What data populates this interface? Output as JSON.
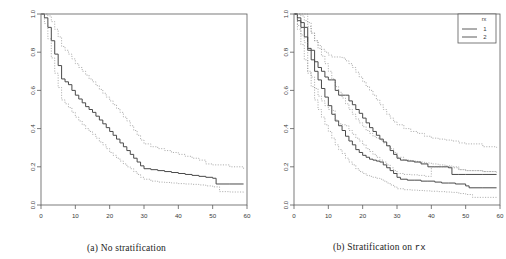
{
  "figure": {
    "panels": [
      {
        "id": "panel-a",
        "caption_prefix": "(a) No stratification",
        "caption_mono": "",
        "has_legend": false
      },
      {
        "id": "panel-b",
        "caption_prefix": "(b) Stratification on ",
        "caption_mono": "rx",
        "has_legend": true
      }
    ],
    "legend": {
      "title": "rx",
      "entries": [
        {
          "label": "1",
          "style": "solid"
        },
        {
          "label": "2",
          "style": "solid"
        }
      ]
    },
    "style": {
      "curve_color": "#4a4a4a",
      "band_color": "#8c8c8c",
      "axis_color": "#5a5a5a",
      "background": "#ffffff"
    }
  },
  "chart_data": [
    {
      "type": "line",
      "title": "(a) No stratification",
      "xlabel": "",
      "ylabel": "",
      "xlim": [
        0,
        60
      ],
      "ylim": [
        0,
        1.0
      ],
      "xticks": [
        0,
        10,
        20,
        30,
        40,
        50,
        60
      ],
      "yticks": [
        0.0,
        0.2,
        0.4,
        0.6,
        0.8,
        1.0
      ],
      "grid": false,
      "legend_position": "none",
      "series": [
        {
          "name": "estimate",
          "style": "step-solid",
          "x": [
            0,
            1,
            2,
            3,
            4,
            5,
            6,
            7,
            8,
            9,
            10,
            11,
            12,
            13,
            14,
            15,
            16,
            17,
            18,
            19,
            20,
            21,
            22,
            23,
            24,
            25,
            26,
            27,
            28,
            29,
            30,
            32,
            34,
            36,
            38,
            40,
            42,
            44,
            46,
            48,
            50,
            51,
            55,
            59
          ],
          "y": [
            1.0,
            0.98,
            0.93,
            0.86,
            0.79,
            0.73,
            0.66,
            0.645,
            0.63,
            0.6,
            0.575,
            0.555,
            0.535,
            0.515,
            0.5,
            0.485,
            0.465,
            0.445,
            0.425,
            0.405,
            0.385,
            0.365,
            0.345,
            0.325,
            0.305,
            0.285,
            0.265,
            0.245,
            0.225,
            0.205,
            0.19,
            0.185,
            0.18,
            0.175,
            0.17,
            0.165,
            0.16,
            0.155,
            0.15,
            0.145,
            0.14,
            0.11,
            0.11,
            0.11
          ]
        },
        {
          "name": "upper-95",
          "style": "step-dotted",
          "x": [
            0,
            1,
            2,
            3,
            4,
            5,
            6,
            7,
            8,
            9,
            10,
            11,
            12,
            13,
            14,
            15,
            16,
            17,
            18,
            19,
            20,
            21,
            22,
            23,
            24,
            25,
            26,
            27,
            28,
            29,
            30,
            32,
            34,
            36,
            38,
            40,
            42,
            44,
            46,
            48,
            50,
            55,
            59
          ],
          "y": [
            1.0,
            1.0,
            0.99,
            0.96,
            0.92,
            0.88,
            0.83,
            0.81,
            0.79,
            0.765,
            0.74,
            0.72,
            0.7,
            0.68,
            0.66,
            0.645,
            0.625,
            0.605,
            0.585,
            0.565,
            0.545,
            0.525,
            0.505,
            0.485,
            0.46,
            0.44,
            0.415,
            0.39,
            0.365,
            0.34,
            0.32,
            0.305,
            0.295,
            0.285,
            0.275,
            0.265,
            0.255,
            0.245,
            0.235,
            0.215,
            0.21,
            0.2,
            0.185
          ]
        },
        {
          "name": "lower-95",
          "style": "step-dotted",
          "x": [
            0,
            1,
            2,
            3,
            4,
            5,
            6,
            7,
            8,
            9,
            10,
            11,
            12,
            13,
            14,
            15,
            16,
            17,
            18,
            19,
            20,
            21,
            22,
            23,
            24,
            25,
            26,
            27,
            28,
            29,
            30,
            32,
            34,
            36,
            38,
            40,
            42,
            44,
            46,
            48,
            50,
            52,
            55,
            59
          ],
          "y": [
            1.0,
            0.95,
            0.87,
            0.77,
            0.69,
            0.615,
            0.55,
            0.53,
            0.51,
            0.485,
            0.46,
            0.44,
            0.42,
            0.4,
            0.385,
            0.37,
            0.35,
            0.33,
            0.315,
            0.295,
            0.275,
            0.26,
            0.245,
            0.23,
            0.215,
            0.2,
            0.19,
            0.175,
            0.16,
            0.145,
            0.135,
            0.125,
            0.12,
            0.118,
            0.115,
            0.112,
            0.11,
            0.108,
            0.105,
            0.1,
            0.095,
            0.07,
            0.068,
            0.065
          ]
        }
      ]
    },
    {
      "type": "line",
      "title": "(b) Stratification on rx",
      "xlabel": "",
      "ylabel": "",
      "xlim": [
        0,
        60
      ],
      "ylim": [
        0,
        1.0
      ],
      "xticks": [
        0,
        10,
        20,
        30,
        40,
        50,
        60
      ],
      "yticks": [
        0.0,
        0.2,
        0.4,
        0.6,
        0.8,
        1.0
      ],
      "grid": false,
      "legend_position": "top-right",
      "legend_title": "rx",
      "series": [
        {
          "name": "rx=1 estimate",
          "style": "step-solid",
          "x": [
            0,
            1,
            2,
            3,
            4,
            5,
            6,
            7,
            8,
            9,
            10,
            11,
            12,
            13,
            14,
            15,
            16,
            17,
            18,
            19,
            20,
            21,
            22,
            23,
            24,
            25,
            26,
            27,
            28,
            29,
            30,
            31,
            33,
            35,
            37,
            39,
            41,
            43,
            45,
            47,
            50,
            51,
            55,
            59
          ],
          "y": [
            1.0,
            0.965,
            0.93,
            0.88,
            0.82,
            0.76,
            0.7,
            0.655,
            0.61,
            0.565,
            0.52,
            0.475,
            0.44,
            0.415,
            0.39,
            0.36,
            0.335,
            0.315,
            0.29,
            0.275,
            0.26,
            0.25,
            0.24,
            0.235,
            0.23,
            0.225,
            0.21,
            0.195,
            0.18,
            0.165,
            0.145,
            0.135,
            0.13,
            0.13,
            0.125,
            0.125,
            0.12,
            0.115,
            0.115,
            0.11,
            0.1,
            0.09,
            0.09,
            0.09
          ]
        },
        {
          "name": "rx=1 upper",
          "style": "step-dotted",
          "x": [
            0,
            1,
            2,
            3,
            4,
            5,
            6,
            7,
            8,
            9,
            10,
            11,
            12,
            13,
            14,
            15,
            16,
            17,
            18,
            19,
            20,
            21,
            22,
            23,
            24,
            25,
            26,
            27,
            28,
            29,
            30,
            32,
            34,
            36,
            38,
            40,
            42,
            44,
            46,
            48,
            50,
            55,
            59
          ],
          "y": [
            1.0,
            1.0,
            0.99,
            0.965,
            0.935,
            0.9,
            0.86,
            0.82,
            0.78,
            0.74,
            0.7,
            0.66,
            0.62,
            0.59,
            0.56,
            0.53,
            0.5,
            0.475,
            0.45,
            0.43,
            0.41,
            0.39,
            0.375,
            0.36,
            0.35,
            0.34,
            0.325,
            0.31,
            0.295,
            0.275,
            0.25,
            0.235,
            0.23,
            0.225,
            0.22,
            0.215,
            0.21,
            0.205,
            0.2,
            0.185,
            0.18,
            0.175,
            0.17
          ]
        },
        {
          "name": "rx=1 lower",
          "style": "step-dotted",
          "x": [
            0,
            1,
            2,
            3,
            4,
            5,
            6,
            7,
            8,
            9,
            10,
            11,
            12,
            13,
            14,
            15,
            16,
            17,
            18,
            19,
            20,
            21,
            22,
            23,
            24,
            25,
            26,
            27,
            28,
            29,
            30,
            32,
            34,
            36,
            38,
            40,
            42,
            44,
            46,
            48,
            50,
            52,
            55,
            59
          ],
          "y": [
            1.0,
            0.92,
            0.84,
            0.76,
            0.69,
            0.62,
            0.55,
            0.5,
            0.46,
            0.42,
            0.385,
            0.35,
            0.315,
            0.29,
            0.27,
            0.245,
            0.225,
            0.21,
            0.19,
            0.175,
            0.165,
            0.155,
            0.15,
            0.145,
            0.14,
            0.135,
            0.125,
            0.115,
            0.105,
            0.095,
            0.085,
            0.08,
            0.078,
            0.076,
            0.074,
            0.072,
            0.07,
            0.068,
            0.066,
            0.06,
            0.055,
            0.04,
            0.04,
            0.04
          ]
        },
        {
          "name": "rx=2 estimate",
          "style": "step-solid",
          "x": [
            0,
            1,
            2,
            3,
            4,
            5,
            6,
            7,
            8,
            9,
            10,
            11,
            12,
            13,
            14,
            15,
            16,
            17,
            18,
            19,
            20,
            21,
            22,
            23,
            24,
            25,
            26,
            27,
            28,
            29,
            30,
            31,
            33,
            35,
            37,
            39,
            41,
            43,
            45,
            46,
            48,
            50,
            55,
            59
          ],
          "y": [
            1.0,
            0.98,
            0.955,
            0.93,
            0.81,
            0.81,
            0.75,
            0.72,
            0.7,
            0.67,
            0.655,
            0.655,
            0.6,
            0.575,
            0.575,
            0.575,
            0.545,
            0.525,
            0.5,
            0.48,
            0.455,
            0.43,
            0.405,
            0.385,
            0.365,
            0.345,
            0.33,
            0.31,
            0.285,
            0.265,
            0.245,
            0.235,
            0.23,
            0.225,
            0.215,
            0.2,
            0.2,
            0.2,
            0.195,
            0.16,
            0.16,
            0.16,
            0.16,
            0.16
          ]
        },
        {
          "name": "rx=2 upper",
          "style": "step-dotted",
          "x": [
            0,
            1,
            2,
            3,
            4,
            5,
            6,
            7,
            8,
            9,
            10,
            11,
            12,
            13,
            14,
            15,
            16,
            17,
            18,
            19,
            20,
            21,
            22,
            23,
            24,
            25,
            26,
            27,
            28,
            29,
            30,
            32,
            34,
            36,
            38,
            40,
            42,
            44,
            46,
            48,
            50,
            55,
            59
          ],
          "y": [
            1.0,
            1.0,
            1.0,
            1.0,
            0.955,
            0.9,
            0.86,
            0.835,
            0.815,
            0.8,
            0.785,
            0.775,
            0.775,
            0.775,
            0.77,
            0.755,
            0.74,
            0.72,
            0.695,
            0.67,
            0.645,
            0.62,
            0.6,
            0.575,
            0.55,
            0.525,
            0.5,
            0.475,
            0.455,
            0.435,
            0.42,
            0.4,
            0.385,
            0.375,
            0.36,
            0.35,
            0.345,
            0.34,
            0.335,
            0.325,
            0.32,
            0.305,
            0.3
          ]
        },
        {
          "name": "rx=2 lower",
          "style": "step-dotted",
          "x": [
            0,
            1,
            2,
            3,
            4,
            5,
            6,
            7,
            8,
            9,
            10,
            11,
            12,
            13,
            14,
            15,
            16,
            17,
            18,
            19,
            20,
            21,
            22,
            23,
            24,
            25,
            26,
            27,
            28,
            29,
            30,
            32,
            34,
            36,
            38,
            40,
            42,
            44,
            46,
            48,
            50,
            55,
            59
          ],
          "y": [
            1.0,
            0.94,
            0.89,
            0.85,
            0.7,
            0.67,
            0.61,
            0.57,
            0.545,
            0.52,
            0.5,
            0.495,
            0.445,
            0.425,
            0.42,
            0.415,
            0.39,
            0.37,
            0.35,
            0.335,
            0.315,
            0.295,
            0.28,
            0.265,
            0.25,
            0.235,
            0.225,
            0.21,
            0.195,
            0.18,
            0.165,
            0.16,
            0.158,
            0.155,
            0.15,
            0.2,
            0.2,
            0.2,
            0.195,
            0.185,
            0.18,
            0.175,
            0.17
          ]
        }
      ]
    }
  ]
}
